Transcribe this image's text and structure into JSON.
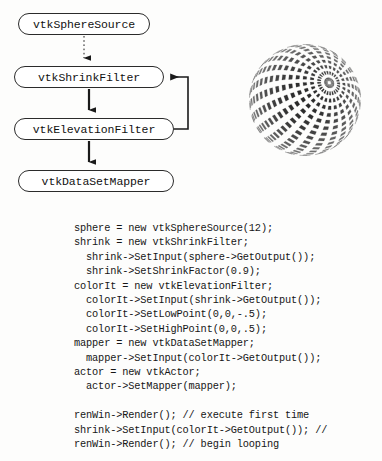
{
  "figure": {
    "kind": "vtk-visualization-pipeline-figure",
    "background_color": "#fdfdfc",
    "ink_color": "#111111"
  },
  "diagram": {
    "nodes": [
      {
        "id": "sphere-source",
        "label": "vtkSphereSource"
      },
      {
        "id": "shrink-filter",
        "label": "vtkShrinkFilter"
      },
      {
        "id": "elevation-filter",
        "label": "vtkElevationFilter"
      },
      {
        "id": "dataset-mapper",
        "label": "vtkDataSetMapper"
      }
    ],
    "edges": [
      {
        "from": "sphere-source",
        "to": "shrink-filter",
        "style": "dotted",
        "arrow": true
      },
      {
        "from": "shrink-filter",
        "to": "elevation-filter",
        "style": "solid",
        "arrow": true
      },
      {
        "from": "elevation-filter",
        "to": "dataset-mapper",
        "style": "solid",
        "arrow": true
      },
      {
        "from": "elevation-filter",
        "to": "shrink-filter",
        "style": "solid",
        "arrow": true,
        "kind": "feedback-loop"
      }
    ]
  },
  "sphere_render": {
    "description": "shrunken-polygon sphere",
    "theta_resolution": 12,
    "phi_resolution": 12,
    "shrink_factor": 0.9
  },
  "code": {
    "language": "cpp",
    "lines": [
      "sphere = new vtkSphereSource(12);",
      "shrink = new vtkShrinkFilter;",
      "  shrink->SetInput(sphere->GetOutput());",
      "  shrink->SetShrinkFactor(0.9);",
      "colorIt = new vtkElevationFilter;",
      "  colorIt->SetInput(shrink->GetOutput());",
      "  colorIt->SetLowPoint(0,0,-.5);",
      "  colorIt->SetHighPoint(0,0,.5);",
      "mapper = new vtkDataSetMapper;",
      "  mapper->SetInput(colorIt->GetOutput());",
      "actor = new vtkActor;",
      "  actor->SetMapper(mapper);",
      "",
      "renWin->Render(); // execute first time",
      "shrink->SetInput(colorIt->GetOutput()); //",
      "renWin->Render(); // begin looping"
    ]
  }
}
